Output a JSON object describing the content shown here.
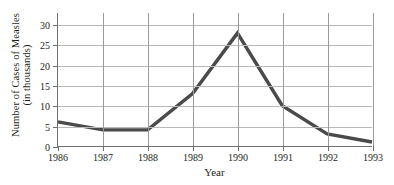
{
  "chart_data": {
    "type": "line",
    "title": "",
    "xlabel": "Year",
    "ylabel": "Number of Cases of Measles (in thousands)",
    "ylabel_line1": "Number of Cases of Measles",
    "ylabel_line2": "(in thousands)",
    "categories": [
      "1986",
      "1987",
      "1988",
      "1989",
      "1990",
      "1991",
      "1992",
      "1993"
    ],
    "values": [
      6,
      4,
      4,
      13,
      28,
      10,
      3,
      1
    ],
    "series": [
      {
        "name": "Measles cases",
        "values": [
          6,
          4,
          4,
          13,
          28,
          10,
          3,
          1
        ]
      }
    ],
    "xticks": [
      "1986",
      "1987",
      "1988",
      "1989",
      "1990",
      "1991",
      "1992",
      "1993"
    ],
    "yticks": [
      0,
      5,
      10,
      15,
      20,
      25,
      30
    ],
    "ylim": [
      0,
      33
    ],
    "xlim": [
      "1986",
      "1993"
    ],
    "grid": true,
    "legend": false,
    "legend_position": "none",
    "line_color": "#4a4a4a",
    "grid_color": "#b9b9b9",
    "vgrid_color": "#9a9a9a",
    "axis_color": "#6f6f6f",
    "background_color": "#ffffff",
    "text_color": "#231f20"
  }
}
